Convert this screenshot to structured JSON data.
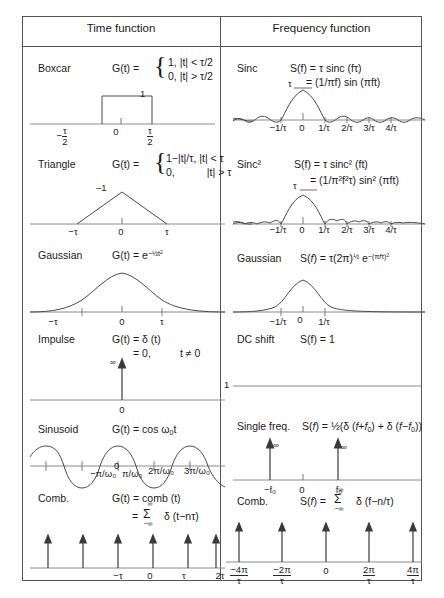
{
  "table": {
    "headers": {
      "time": "Time function",
      "frequency": "Frequency function"
    }
  },
  "rows": [
    {
      "id": "boxcar",
      "time": {
        "name": "Boxcar",
        "lhs": "G(t) =",
        "piece1": "1, |t| < τ/2",
        "piece2": "0, |t| > τ/2",
        "peak_label": "1",
        "ticks": [
          "−τ/2",
          "0",
          "τ/2"
        ]
      },
      "freq": {
        "name": "Sinc",
        "line1": "S(f) = τ sinc (fτ)",
        "line2": "= (1/πf) sin (πft)",
        "peak_label": "τ",
        "ticks": [
          "−1/τ",
          "0",
          "1/τ",
          "2/τ",
          "3/τ",
          "4/τ"
        ]
      }
    },
    {
      "id": "triangle",
      "time": {
        "name": "Triangle",
        "lhs": "G(t) =",
        "piece1": "1−|t|/τ, |t| < τ",
        "piece2": "0,           |t| > τ",
        "peak_label": "–1",
        "ticks": [
          "−τ",
          "0",
          "τ"
        ]
      },
      "freq": {
        "name": "Sinc²",
        "line1": "S(f) = τ sinc² (ft)",
        "line2": "= (1/π²f²τ) sin² (πft)",
        "peak_label": "τ",
        "ticks": [
          "−1/τ",
          "0",
          "1/τ",
          "2/τ",
          "3/τ",
          "4/τ"
        ]
      }
    },
    {
      "id": "gaussian",
      "time": {
        "name": "Gaussian",
        "line1": "G(t) = e−½t²",
        "ticks": [
          "−τ",
          "0",
          "τ"
        ]
      },
      "freq": {
        "name": "Gaussian",
        "line1": "S(f) = τ(2π)½ e−(πfτ)²",
        "ticks": [
          "−1/τ",
          "0",
          "1/τ"
        ]
      }
    },
    {
      "id": "impulse",
      "time": {
        "name": "Impulse",
        "line1": "G(t) = δ (t)",
        "line2": "= 0,",
        "line3": "t ≠ 0",
        "inf_label": "∞",
        "ticks": [
          "0"
        ]
      },
      "freq": {
        "name": "DC shift",
        "line1": "S(f) = 1",
        "level_label": "1"
      }
    },
    {
      "id": "sinusoid",
      "time": {
        "name": "Sinusoid",
        "line1": "G(t) = cos ω₀t",
        "ticks": [
          "−π/ω₀",
          "0",
          "π/ω₀",
          "2π/ω₀",
          "3π/ω₀"
        ]
      },
      "freq": {
        "name": "Single freq.",
        "line1": "S(f) = ½(δ (f+f₀) + δ (f−f₀))",
        "inf_label": "∞",
        "ticks": [
          "−f₀",
          "0",
          "f₀"
        ]
      }
    },
    {
      "id": "comb",
      "time": {
        "name": "Comb.",
        "line1": "G(t) = comb (t)",
        "line2_eq": "=",
        "sum_top": "∞",
        "sum_sym": "Σ",
        "sum_bot": "−∞",
        "line2_body": "δ (t−nτ)",
        "ticks": [
          "−τ",
          "0",
          "τ",
          "2τ",
          "3τ"
        ]
      },
      "freq": {
        "name": "Comb.",
        "line1_lhs": "S(f) =",
        "sum_top": "∞",
        "sum_sym": "Σ",
        "sum_bot": "−∞",
        "line1_body": "δ (f−n/τ)",
        "ticks_num": [
          "−4π",
          "−2π",
          "0",
          "2π",
          "4π"
        ],
        "ticks_den": [
          "τ",
          "τ",
          "",
          "τ",
          "τ"
        ]
      }
    }
  ],
  "colors": {
    "border": "#555555",
    "curve": "#4a4a4a",
    "axis": "#8a8a8a",
    "text": "#1a1a1a"
  }
}
